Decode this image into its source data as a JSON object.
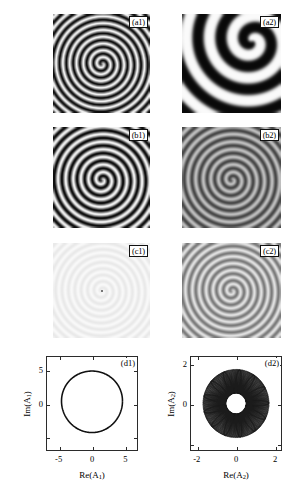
{
  "figure": {
    "kind": "multi-panel scientific figure",
    "columns": 2,
    "rows": 4,
    "background_color": "#ffffff"
  },
  "panels": [
    {
      "id": "a1",
      "label": "(a1)",
      "type": "spiral-field",
      "row": 1,
      "column": 1,
      "description": "high-contrast black and white tightly wound spiral wave",
      "arms": 1,
      "turns": 7.0,
      "contrast": "high",
      "low_color": "#0a0a0a",
      "high_color": "#f5f5f5",
      "wavelength_px": 6.8,
      "core_x_frac": 0.5,
      "core_y_frac": 0.5,
      "blur_px": 0.7,
      "rotation_deg": 0
    },
    {
      "id": "a2",
      "label": "(a2)",
      "type": "spiral-field",
      "row": 1,
      "column": 2,
      "description": "high-contrast broad spiral with few wide arms, core near upper right",
      "arms": 1,
      "turns": 2.1,
      "contrast": "high",
      "low_color": "#080808",
      "high_color": "#fbfbfb",
      "wavelength_px": 23.0,
      "core_x_frac": 0.7,
      "core_y_frac": 0.27,
      "blur_px": 2.2,
      "rotation_deg": 30
    },
    {
      "id": "b1",
      "label": "(b1)",
      "type": "spiral-field",
      "row": 2,
      "column": 1,
      "description": "high-contrast spiral, slightly coarser than (a1)",
      "arms": 1,
      "turns": 6.2,
      "contrast": "high",
      "low_color": "#0b0b0b",
      "high_color": "#f2f2f2",
      "wavelength_px": 7.6,
      "core_x_frac": 0.5,
      "core_y_frac": 0.52,
      "blur_px": 0.8,
      "rotation_deg": 10
    },
    {
      "id": "b2",
      "label": "(b2)",
      "type": "spiral-field",
      "row": 2,
      "column": 2,
      "description": "medium-contrast gray spiral, same pitch as (b1)",
      "arms": 1,
      "turns": 6.2,
      "contrast": "medium",
      "low_color": "#3c3c3c",
      "high_color": "#c9c9c9",
      "wavelength_px": 7.6,
      "core_x_frac": 0.5,
      "core_y_frac": 0.52,
      "blur_px": 0.9,
      "rotation_deg": 10
    },
    {
      "id": "c1",
      "label": "(c1)",
      "type": "spiral-field",
      "row": 3,
      "column": 1,
      "description": "very faint near-white spiral, almost no contrast, dark pixel at core",
      "arms": 1,
      "turns": 7.4,
      "contrast": "very-low",
      "low_color": "#e4e4e4",
      "high_color": "#fdfdfd",
      "wavelength_px": 6.4,
      "core_x_frac": 0.5,
      "core_y_frac": 0.5,
      "blur_px": 0.5,
      "rotation_deg": 0,
      "core_dot": true
    },
    {
      "id": "c2",
      "label": "(c2)",
      "type": "spiral-field",
      "row": 3,
      "column": 2,
      "description": "medium-gray spiral on light background, moderate contrast",
      "arms": 1,
      "turns": 7.0,
      "contrast": "medium",
      "low_color": "#6e6e6e",
      "high_color": "#ededed",
      "wavelength_px": 6.9,
      "core_x_frac": 0.5,
      "core_y_frac": 0.5,
      "blur_px": 0.6,
      "rotation_deg": 0
    },
    {
      "id": "d1",
      "label": "(d1)",
      "type": "phase-portrait",
      "row": 4,
      "column": 1
    },
    {
      "id": "d2",
      "label": "(d2)",
      "type": "phase-portrait",
      "row": 4,
      "column": 2
    }
  ],
  "chart_data": [
    {
      "id": "d1",
      "type": "line",
      "title": "(d1)",
      "xlabel": "Re(A₁)",
      "ylabel": "Im(A₁)",
      "xlim": [
        -6.2,
        6.2
      ],
      "ylim": [
        -6.2,
        6.2
      ],
      "xticks": [
        -5,
        0,
        5
      ],
      "xticklabels": [
        "-5",
        "0",
        "5"
      ],
      "yticks": [
        -5,
        0,
        5
      ],
      "yticklabels": [
        "",
        "0",
        "5"
      ],
      "grid": false,
      "legend": false,
      "orbit": {
        "shape": "limit-cycle-circle",
        "radius": 4.15,
        "center": [
          0.0,
          0.25
        ],
        "line_color": "#111111",
        "line_width": 1.6,
        "description": "single closed periodic orbit (limit cycle) of amplitude A1"
      }
    },
    {
      "id": "d2",
      "type": "line",
      "title": "(d2)",
      "xlabel": "Re(A₂)",
      "ylabel": "Im(A₂)",
      "xlim": [
        -2.35,
        2.35
      ],
      "ylim": [
        -2.35,
        2.35
      ],
      "xticks": [
        -2,
        0,
        2
      ],
      "xticklabels": [
        "-2",
        "0",
        "2"
      ],
      "yticks": [
        -2,
        0,
        2
      ],
      "yticklabels": [
        "",
        "0",
        "2"
      ],
      "grid": false,
      "legend": false,
      "orbit": {
        "shape": "quasiperiodic-torus-annulus",
        "outer_radius": 1.72,
        "inner_radius": 0.52,
        "center": [
          0.0,
          0.0
        ],
        "petals": 13,
        "windings": 46,
        "line_color": "#1a1a1a",
        "line_width": 0.45,
        "description": "dense quasi-periodic trajectory filling an annulus with rosette petal structure"
      }
    }
  ]
}
